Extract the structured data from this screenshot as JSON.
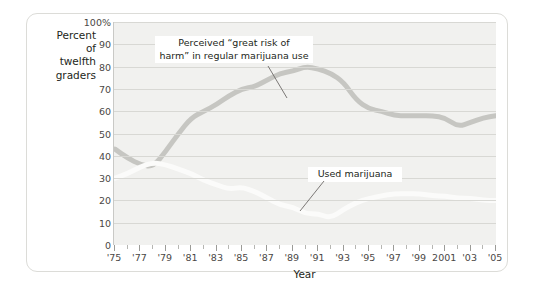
{
  "axis_title_lines": [
    "Percent",
    "of",
    "twelfth",
    "graders"
  ],
  "xaxis_label": "Year",
  "annotations": {
    "risk_line1": "Perceived “great risk of",
    "risk_line2": "harm” in regular marijuana use",
    "used": "Used marijuana"
  },
  "colors": {
    "plot_background": "#f1f1ef",
    "gridline": "#d8d8d4",
    "risk_series": "#c6c6c2",
    "used_series": "#fbfbfa",
    "panel_border": "#dcdcd8",
    "text": "#231f20",
    "tick_text": "#4a4745"
  },
  "chart_data": {
    "type": "line",
    "title": "",
    "subtitle": "",
    "xlabel": "Year",
    "ylabel": "Percent of twelfth graders",
    "xlim": [
      1975,
      2005
    ],
    "ylim": [
      0,
      100
    ],
    "yticks": [
      0,
      10,
      20,
      30,
      40,
      50,
      60,
      70,
      80,
      90,
      100
    ],
    "ytick_labels": [
      "0",
      "10",
      "20",
      "30",
      "40",
      "50",
      "60",
      "70",
      "80",
      "90",
      "100%"
    ],
    "xticks": [
      1975,
      1977,
      1979,
      1981,
      1983,
      1985,
      1987,
      1989,
      1991,
      1993,
      1995,
      1997,
      1999,
      2001,
      2003,
      2005
    ],
    "xtick_labels": [
      "'75",
      "'77",
      "'79",
      "'81",
      "'83",
      "'85",
      "'87",
      "'89",
      "'91",
      "'93",
      "'95",
      "'97",
      "'99",
      "2001",
      "'03",
      "'05"
    ],
    "xtick_minor_step": 1,
    "grid": true,
    "grid_axis": "y",
    "legend": "annotations-inline",
    "x": [
      1975,
      1976,
      1977,
      1978,
      1979,
      1980,
      1981,
      1982,
      1983,
      1984,
      1985,
      1986,
      1987,
      1988,
      1989,
      1990,
      1991,
      1992,
      1993,
      1994,
      1995,
      1996,
      1997,
      1998,
      1999,
      2000,
      2001,
      2002,
      2003,
      2004,
      2005
    ],
    "series": [
      {
        "name": "Perceived “great risk of harm” in regular marijuana use",
        "color": "#c6c6c2",
        "values": [
          43,
          39,
          36,
          35,
          42,
          50,
          57,
          60,
          63,
          67,
          70,
          71,
          74,
          77,
          78,
          80,
          79,
          77,
          73,
          65,
          61,
          60,
          58,
          58,
          58,
          58,
          57,
          53,
          55,
          57,
          58
        ]
      },
      {
        "name": "Used marijuana",
        "color": "#fbfbfa",
        "values": [
          30,
          32,
          35,
          37,
          36,
          34,
          32,
          29,
          27,
          25,
          26,
          24,
          21,
          18,
          17,
          14,
          14,
          12,
          16,
          19,
          21,
          22,
          23,
          23,
          23,
          22,
          22,
          21,
          21,
          20,
          20
        ]
      }
    ]
  }
}
